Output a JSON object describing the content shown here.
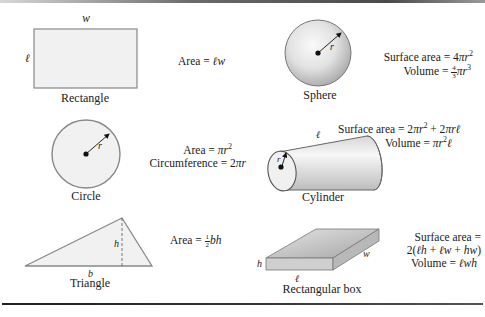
{
  "shapes": {
    "rectangle": {
      "label": "Rectangle",
      "dims": {
        "w": "w",
        "l": "ℓ"
      },
      "formulas": {
        "area": "Area = ℓw"
      }
    },
    "sphere": {
      "label": "Sphere",
      "dims": {
        "r": "r"
      },
      "formulas": {
        "surface_area": "Surface area = 4πr²",
        "volume": "Volume = ⁴⁄₃πr³"
      }
    },
    "circle": {
      "label": "Circle",
      "dims": {
        "r": "r"
      },
      "formulas": {
        "area": "Area = πr²",
        "circumference": "Circumference = 2πr"
      }
    },
    "cylinder": {
      "label": "Cylinder",
      "dims": {
        "r": "r",
        "l": "ℓ"
      },
      "formulas": {
        "surface_area": "Surface area = 2πr² + 2πrℓ",
        "volume": "Volume = πr²ℓ"
      }
    },
    "triangle": {
      "label": "Triangle",
      "dims": {
        "b": "b",
        "h": "h"
      },
      "formulas": {
        "area": "Area = ½bh"
      }
    },
    "rectangular_box": {
      "label": "Rectangular box",
      "dims": {
        "h": "h",
        "w": "w",
        "l": "ℓ"
      },
      "formulas": {
        "surface_area_1": "Surface area =",
        "surface_area_2": "2(ℓh + ℓw + hw)",
        "volume": "Volume = ℓwh"
      }
    }
  },
  "text_parts": {
    "rect_area_prefix": "Area = ",
    "rect_area_vars": "ℓw",
    "sphere_sa_prefix": "Surface area = 4",
    "sphere_sa_vars": "πr",
    "sphere_sa_exp": "2",
    "sphere_vol_prefix": "Volume = ",
    "sphere_vol_num": "4",
    "sphere_vol_den": "3",
    "sphere_vol_vars": "πr",
    "sphere_vol_exp": "3",
    "circle_area_prefix": "Area = ",
    "circle_area_vars": "πr",
    "circle_area_exp": "2",
    "circle_circ_prefix": "Circumference = 2",
    "circle_circ_vars": "πr",
    "cyl_sa_prefix": "Surface area = 2",
    "cyl_sa_vars1": "πr",
    "cyl_sa_exp": "2",
    "cyl_sa_mid": " + 2",
    "cyl_sa_vars2": "πrℓ",
    "cyl_vol_prefix": "Volume = ",
    "cyl_vol_vars1": "πr",
    "cyl_vol_exp": "2",
    "cyl_vol_vars2": "ℓ",
    "tri_area_prefix": "Area = ",
    "tri_area_num": "1",
    "tri_area_den": "2",
    "tri_area_vars": "bh",
    "box_sa_line1": "Surface area =",
    "box_sa_line2_a": "2(",
    "box_sa_line2_b": "ℓh",
    "box_sa_line2_c": " + ",
    "box_sa_line2_d": "ℓw",
    "box_sa_line2_e": " + ",
    "box_sa_line2_f": "hw",
    "box_sa_line2_g": ")",
    "box_vol_prefix": "Volume = ",
    "box_vol_vars": "ℓwh"
  },
  "colors": {
    "fill_light": "#eeeeee",
    "stroke": "#777777",
    "sphere_light": "#f8f8f8",
    "sphere_dark": "#a8a8a8",
    "rule": "#333333"
  }
}
